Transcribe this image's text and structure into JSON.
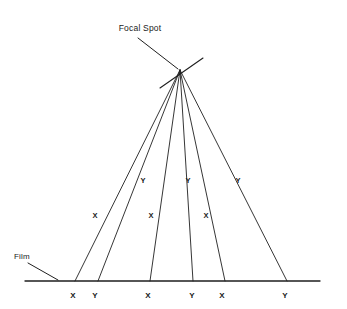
{
  "diagram": {
    "title_label": "Focal Spot",
    "film_label": "Film",
    "stroke_color": "#1f1f1f",
    "background_color": "#ffffff",
    "canvas": {
      "width": 347,
      "height": 309
    },
    "focal_spot": {
      "x": 180,
      "y": 70
    },
    "target_line": {
      "x1": 160,
      "y1": 88,
      "x2": 203,
      "y2": 58
    },
    "title_leader": {
      "x1": 138,
      "y1": 38,
      "x2": 178,
      "y2": 69
    },
    "film_line": {
      "x1": 25,
      "y1": 281,
      "x2": 320,
      "y2": 281
    },
    "film_leader": {
      "x1": 28,
      "y1": 263,
      "x2": 58,
      "y2": 280
    },
    "rays": [
      {
        "name": "ray-1",
        "end_x": 75,
        "end_y": 281
      },
      {
        "name": "ray-2",
        "end_x": 98,
        "end_y": 281
      },
      {
        "name": "ray-3",
        "end_x": 150,
        "end_y": 281
      },
      {
        "name": "ray-4",
        "end_x": 193,
        "end_y": 281
      },
      {
        "name": "ray-5",
        "end_x": 225,
        "end_y": 281
      },
      {
        "name": "ray-6",
        "end_x": 287,
        "end_y": 281
      }
    ],
    "film_marks": [
      {
        "label": "X",
        "x": 73
      },
      {
        "label": "Y",
        "x": 95
      },
      {
        "label": "X",
        "x": 148
      },
      {
        "label": "Y",
        "x": 192
      },
      {
        "label": "X",
        "x": 222
      },
      {
        "label": "Y",
        "x": 285
      }
    ],
    "film_mark_label_y": 295,
    "mid_marks": [
      {
        "label": "X",
        "x": 95,
        "y": 215
      },
      {
        "label": "Y",
        "x": 143,
        "y": 180
      },
      {
        "label": "X",
        "x": 151,
        "y": 215
      },
      {
        "label": "Y",
        "x": 188,
        "y": 180
      },
      {
        "label": "X",
        "x": 206,
        "y": 215
      },
      {
        "label": "Y",
        "x": 238,
        "y": 180
      }
    ]
  }
}
